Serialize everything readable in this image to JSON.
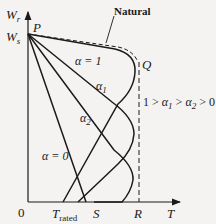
{
  "diagram": {
    "type": "torque-speed-characteristics",
    "axes": {
      "y_labels": {
        "wr": "W",
        "wr_sub": "r",
        "ws": "W",
        "ws_sub": "s"
      },
      "x_label": "T",
      "origin": "0"
    },
    "points": {
      "p": "P",
      "q": "Q"
    },
    "x_ticks": {
      "t_rated": "T",
      "t_rated_sub": "rated",
      "s": "S",
      "r": "R"
    },
    "curves": [
      {
        "id": "natural",
        "label": "Natural",
        "style": "dashed"
      },
      {
        "id": "alpha-1",
        "label": "α = 1"
      },
      {
        "id": "alpha-1-sub",
        "label": "α",
        "sub": "1"
      },
      {
        "id": "alpha-2",
        "label": "α",
        "sub": "2"
      },
      {
        "id": "alpha-0",
        "label": "α = 0"
      }
    ],
    "inequality": {
      "a": "1 > α",
      "a_sub": "1",
      "b": " > α",
      "b_sub": "2",
      "c": " > 0"
    },
    "colors": {
      "line": "#1a1a1a",
      "background": "#f4f3f1"
    }
  }
}
